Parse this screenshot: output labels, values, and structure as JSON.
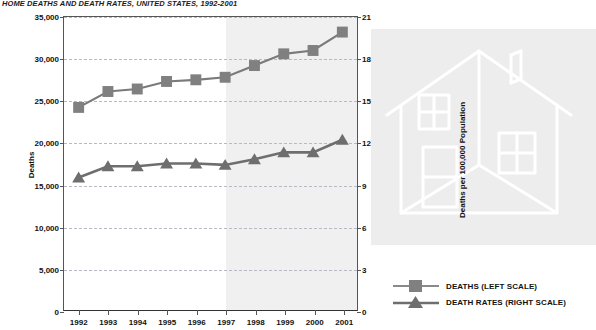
{
  "title": "HOME DEATHS AND DEATH RATES, UNITED STATES, 1992-2001",
  "colors": {
    "marker": "#808080",
    "line": "#7a7a7a",
    "rate_marker": "#6e6e6e",
    "grid": "#b9b9c4",
    "axis": "#555555",
    "shade": "#f0f0f0",
    "panel": "#ededed",
    "watermark": "#ffffff"
  },
  "axis_titles": {
    "left": "Deaths",
    "right": "Deaths per 100,000 Population"
  },
  "legend": {
    "items": [
      {
        "label": "DEATHS (LEFT SCALE)",
        "marker": "square"
      },
      {
        "label": "DEATH RATES (RIGHT SCALE)",
        "marker": "triangle"
      }
    ]
  },
  "watermark": {
    "icon": "house-icon"
  },
  "chart_data": {
    "type": "line",
    "title": "HOME DEATHS AND DEATH RATES, UNITED STATES, 1992-2001",
    "xlabel": "",
    "categories": [
      "1992",
      "1993",
      "1994",
      "1995",
      "1996",
      "1997",
      "1998",
      "1999",
      "2000",
      "2001"
    ],
    "grid": true,
    "legend_position": "right",
    "shaded_region": {
      "from": "1997",
      "to": "2001",
      "color": "#f0f0f0"
    },
    "axes": [
      {
        "id": "left",
        "ylabel": "Deaths",
        "ylim": [
          0,
          35000
        ],
        "ticks": [
          0,
          5000,
          10000,
          15000,
          20000,
          25000,
          30000,
          35000
        ],
        "ticklabels": [
          "0",
          "5,000",
          "10,000",
          "15,000",
          "20,000",
          "25,000",
          "30,000",
          "35,000"
        ]
      },
      {
        "id": "right",
        "ylabel": "Deaths per 100,000 Population",
        "ylim": [
          0,
          21
        ],
        "ticks": [
          0,
          3,
          6,
          9,
          12,
          15,
          18,
          21
        ],
        "ticklabels": [
          "0",
          "3",
          "6",
          "9",
          "12",
          "15",
          "18",
          "21"
        ]
      }
    ],
    "series": [
      {
        "name": "DEATHS (LEFT SCALE)",
        "axis": "left",
        "marker": "square",
        "values": [
          24200,
          26100,
          26400,
          27300,
          27500,
          27800,
          29200,
          30600,
          31000,
          33200
        ]
      },
      {
        "name": "DEATH RATES (RIGHT SCALE)",
        "axis": "right",
        "marker": "triangle",
        "values": [
          9.5,
          10.3,
          10.3,
          10.5,
          10.5,
          10.4,
          10.8,
          11.3,
          11.3,
          12.2
        ]
      }
    ]
  }
}
